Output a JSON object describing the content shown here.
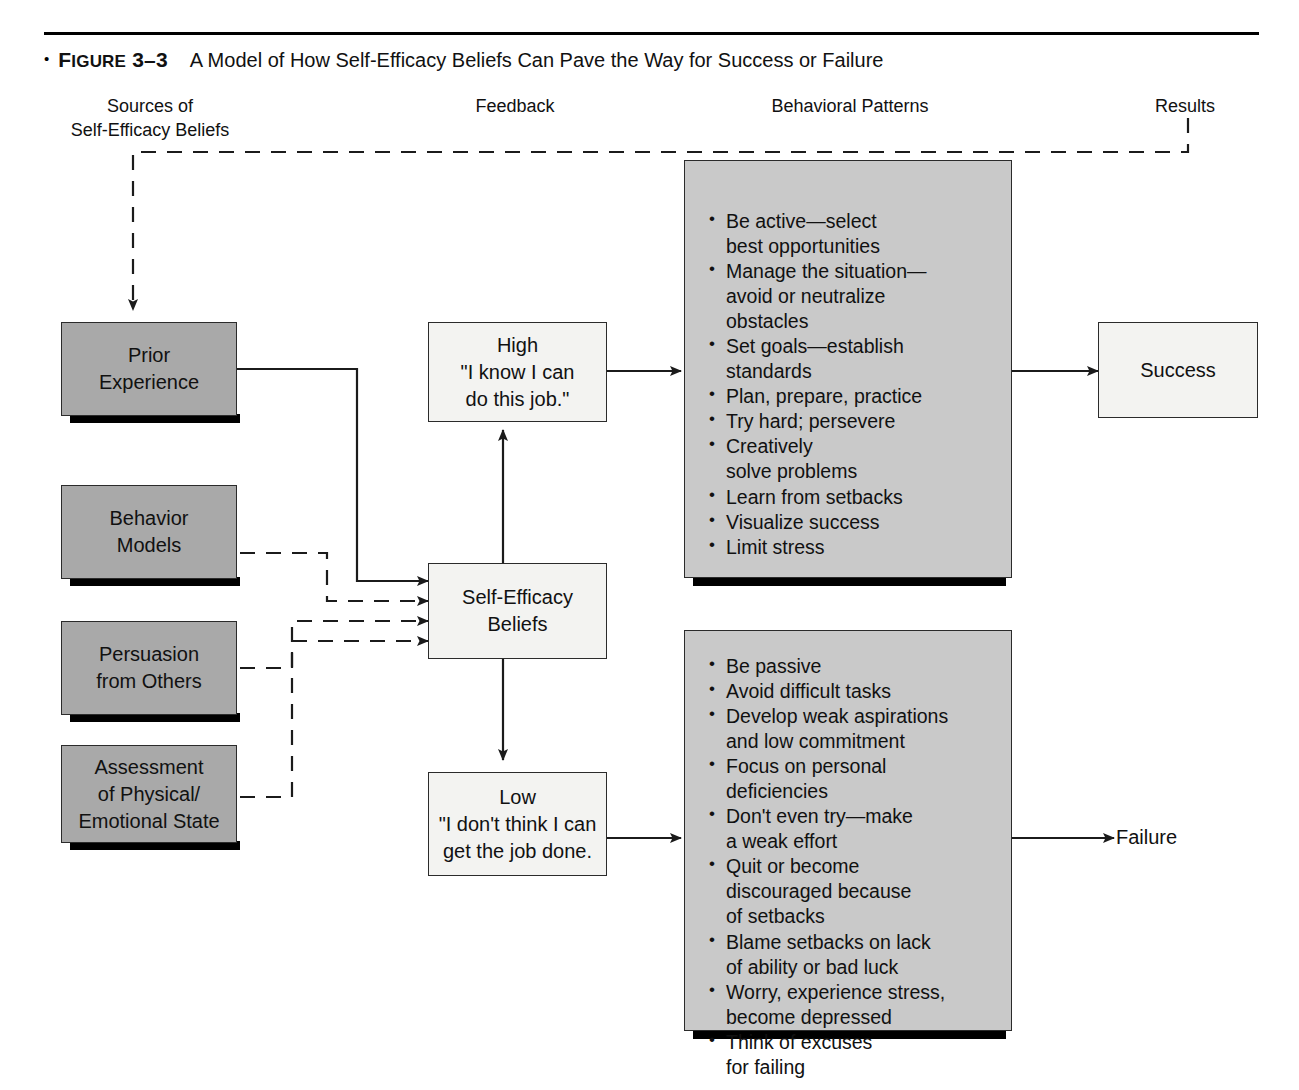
{
  "figure": {
    "bullet": "•",
    "label_first": "F",
    "label_rest": "IGURE",
    "number": " 3–3",
    "title": "A Model of How Self-Efficacy Beliefs Can Pave the Way for Success or Failure"
  },
  "columns": [
    {
      "name": "sources",
      "label": "Sources of\nSelf-Efficacy Beliefs"
    },
    {
      "name": "feedback",
      "label": "Feedback"
    },
    {
      "name": "behavioral",
      "label": "Behavioral Patterns"
    },
    {
      "name": "results",
      "label": "Results"
    }
  ],
  "sources": [
    {
      "name": "prior-experience",
      "label": "Prior\nExperience"
    },
    {
      "name": "behavior-models",
      "label": "Behavior\nModels"
    },
    {
      "name": "persuasion-from-others",
      "label": "Persuasion\nfrom Others"
    },
    {
      "name": "assessment-of-state",
      "label": "Assessment\nof Physical/\nEmotional State"
    }
  ],
  "feedback": {
    "high": {
      "label": "High\n\"I know I can\ndo this job.\""
    },
    "self_efficacy": {
      "label": "Self-Efficacy\nBeliefs"
    },
    "low": {
      "label": "Low\n\"I don't think I can\nget the job done."
    }
  },
  "behavioral_patterns": {
    "high_list": [
      "Be active—select\nbest opportunities",
      "Manage the situation—\navoid or neutralize\nobstacles",
      "Set  goals—establish\nstandards",
      "Plan, prepare, practice",
      "Try hard; persevere",
      "Creatively\nsolve problems",
      "Learn from setbacks",
      "Visualize success",
      "Limit stress"
    ],
    "low_list": [
      "Be passive",
      "Avoid difficult tasks",
      "Develop weak aspirations\nand low commitment",
      "Focus on personal\ndeficiencies",
      "Don't even try—make\na weak effort",
      "Quit or become\ndiscouraged because\nof setbacks",
      "Blame setbacks on lack\nof ability or bad luck",
      "Worry, experience stress,\nbecome depressed",
      "Think of excuses\nfor failing"
    ]
  },
  "results": {
    "success": {
      "label": "Success"
    },
    "failure": {
      "label": "Failure"
    }
  },
  "colors": {
    "source_box_fill": "#a9a9a9",
    "list_box_fill": "#c9c9c9",
    "light_box_fill": "#f3f3f1",
    "stroke": "#2b2b2b",
    "page_background": "#ffffff"
  }
}
